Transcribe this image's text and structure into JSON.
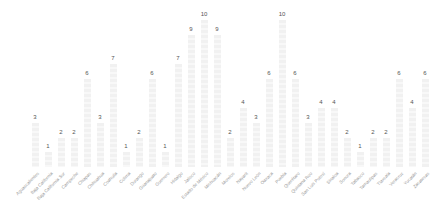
{
  "chart_data": {
    "type": "bar",
    "title": "",
    "xlabel": "",
    "ylabel": "",
    "ylim": [
      0,
      10
    ],
    "grid": false,
    "legend": null,
    "categories": [
      "Aguascalientes",
      "Baja California",
      "Baja California Sur",
      "Campeche",
      "Chiapas",
      "Chihuahua",
      "Coahuila",
      "Colima",
      "Durango",
      "Guanajuato",
      "Guerrero",
      "Hidalgo",
      "Jalisco",
      "Estado de México",
      "Michoacán",
      "Morelos",
      "Nayarit",
      "Nuevo León",
      "Oaxaca",
      "Puebla",
      "Querétaro",
      "Quintana Roo",
      "San Luis Potosí",
      "Sinaloa",
      "Sonora",
      "Tabasco",
      "Tamaulipas",
      "Tlaxcala",
      "Veracruz",
      "Yucatán",
      "Zacatecas"
    ],
    "values": [
      3,
      1,
      2,
      2,
      6,
      3,
      7,
      1,
      2,
      6,
      1,
      7,
      9,
      10,
      9,
      2,
      4,
      3,
      6,
      10,
      6,
      3,
      4,
      4,
      2,
      1,
      2,
      2,
      6,
      4,
      6
    ],
    "data_labels": true
  },
  "style": {
    "bar_color": "#f1f1f1",
    "value_label_color": "#555555",
    "category_label_color": "#9a9a9a"
  }
}
